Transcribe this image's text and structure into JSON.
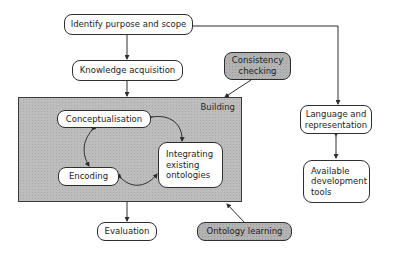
{
  "diagram": {
    "title": "",
    "colors": {
      "node_fill": "#ffffff",
      "highlight_fill": "#b3b3b3",
      "building_fill": "#bdbdbd",
      "stroke": "#2e2e2e"
    },
    "nodes": {
      "identify": {
        "label": "Identify purpose and scope"
      },
      "knowledge": {
        "label": "Knowledge acquisition"
      },
      "consistency": {
        "label": "Consistency checking",
        "line1": "Consistency",
        "line2": "checking"
      },
      "building": {
        "label": "Building"
      },
      "conceptualisation": {
        "label": "Conceptualisation"
      },
      "encoding": {
        "label": "Encoding"
      },
      "integrating": {
        "label": "Integrating existing ontologies",
        "line1": "Integrating",
        "line2": "existing",
        "line3": "ontologies"
      },
      "evaluation": {
        "label": "Evaluation"
      },
      "ontology_learning": {
        "label": "Ontology learning"
      },
      "language": {
        "label": "Language and representation",
        "line1": "Language and",
        "line2": "representation"
      },
      "tools": {
        "label": "Available development tools",
        "line1": "Available",
        "line2": "development",
        "line3": "tools"
      }
    },
    "edges": [
      {
        "from": "identify",
        "to": "knowledge"
      },
      {
        "from": "knowledge",
        "to": "building"
      },
      {
        "from": "identify",
        "to": "language"
      },
      {
        "from": "consistency",
        "to": "building"
      },
      {
        "from": "ontology_learning",
        "to": "building"
      },
      {
        "from": "building",
        "to": "evaluation"
      },
      {
        "from": "language",
        "to": "tools",
        "bidirectional": true
      },
      {
        "from": "conceptualisation",
        "to": "encoding",
        "bidirectional": true
      },
      {
        "from": "encoding",
        "to": "integrating",
        "bidirectional": true
      },
      {
        "from": "integrating",
        "to": "conceptualisation",
        "bidirectional": true
      }
    ]
  }
}
